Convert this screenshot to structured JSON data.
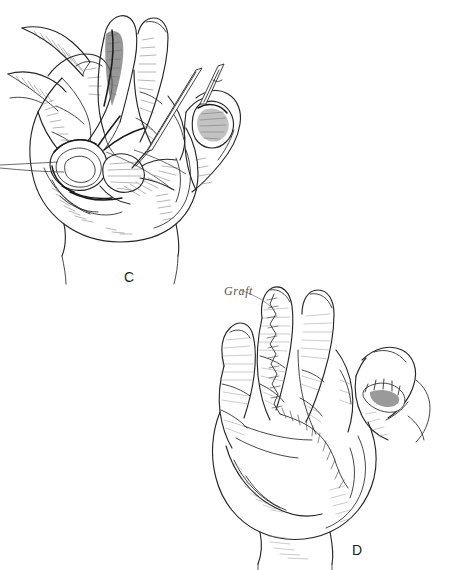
{
  "figure": {
    "background_color": "#ffffff",
    "ink_color": "#262626",
    "hatch_color": "#6d6d6d",
    "medium": "pen-and-ink line drawing"
  },
  "panels": [
    {
      "id": "c",
      "label": "C",
      "label_position": {
        "x": 124,
        "y": 269
      },
      "caption_text": "C",
      "description": "Opened palm with fingers extended, skin flaps retracted, palmar fascia exposed, needle and suture in the first web space"
    },
    {
      "id": "d",
      "label": "D",
      "label_position": {
        "x": 352,
        "y": 542
      },
      "caption_text": "D",
      "description": "Palm after closure with a full-thickness skin graft sutured from the middle finger across the palm and into the thumb web"
    }
  ],
  "annotations": [
    {
      "id": "graft",
      "text": "Graft",
      "style": "handwritten-italic",
      "color": "#555555",
      "position": {
        "x": 224,
        "y": 284
      },
      "leader_line": true,
      "points_to": "sutured graft margin on middle finger"
    }
  ],
  "colors": {
    "ink": "#262626",
    "hatching": "#6d6d6d",
    "deep_shadow": "#1a1a1a",
    "suture": "#3a3a3a",
    "label": "#1d1d1d",
    "annotation": "#555555",
    "paper": "#ffffff"
  }
}
